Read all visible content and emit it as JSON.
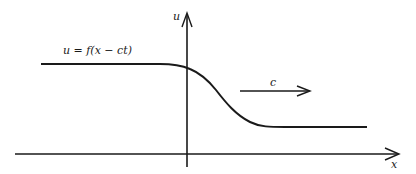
{
  "diagram": {
    "type": "traveling-wave",
    "colors": {
      "stroke": "#1a1a1a",
      "background": "#ffffff"
    },
    "axes": {
      "x_label": "x",
      "y_label": "u"
    },
    "wave_label": "u = f(x − ct)",
    "velocity_label": "c",
    "profile": {
      "upper_plateau": "left, high value",
      "lower_plateau": "right, low value",
      "shape": "smooth decreasing step (kink/front)"
    },
    "velocity_direction": "right"
  }
}
